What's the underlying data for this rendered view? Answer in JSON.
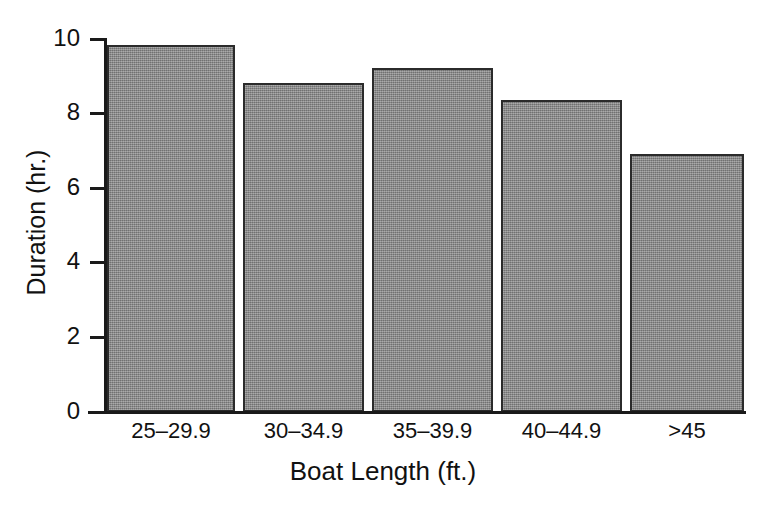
{
  "chart_data": {
    "type": "bar",
    "title": "",
    "xlabel": "Boat Length (ft.)",
    "ylabel": "Duration (hr.)",
    "categories": [
      "25–29.9",
      "30–34.9",
      "35–39.9",
      "40–44.9",
      ">45"
    ],
    "values": [
      9.8,
      8.8,
      9.2,
      8.35,
      6.9
    ],
    "ylim": [
      0,
      10
    ],
    "yticks": [
      0,
      2,
      4,
      6,
      8,
      10
    ],
    "ytick_labels": [
      "0",
      "2",
      "4",
      "6",
      "8",
      "10"
    ],
    "grid": false,
    "legend": false,
    "bar_color": "#8a8a8a",
    "bar_edge_color": "#2b2b2b",
    "axis_color": "#1a1a1a"
  }
}
